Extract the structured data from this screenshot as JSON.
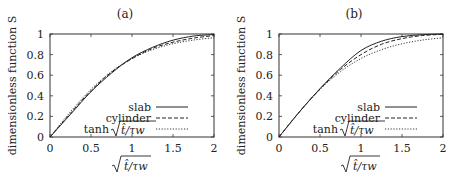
{
  "chart_data": [
    {
      "panel": "(a)",
      "type": "line",
      "title": "(a)",
      "xlabel": "√(t̂/τw)",
      "ylabel": "dimensionless function S",
      "xlim": [
        0,
        2
      ],
      "ylim": [
        0,
        1
      ],
      "xticks": [
        "0",
        "0.5",
        "1",
        "1.5",
        "2"
      ],
      "yticks": [
        "0",
        "0.2",
        "0.4",
        "0.6",
        "0.8",
        "1"
      ],
      "grid": false,
      "legend_position": "lower right",
      "x": [
        0,
        0.25,
        0.5,
        0.75,
        1.0,
        1.25,
        1.5,
        1.75,
        2.0
      ],
      "series": [
        {
          "name": "slab",
          "style": "solid",
          "values": [
            0,
            0.22,
            0.44,
            0.62,
            0.77,
            0.87,
            0.94,
            0.98,
            0.995
          ]
        },
        {
          "name": "cylinder",
          "style": "dashed",
          "values": [
            0,
            0.23,
            0.45,
            0.63,
            0.76,
            0.86,
            0.92,
            0.96,
            0.985
          ]
        },
        {
          "name": "tanh √(t̂/τw)",
          "style": "dotted",
          "values": [
            0,
            0.245,
            0.462,
            0.635,
            0.762,
            0.848,
            0.905,
            0.941,
            0.964
          ]
        }
      ]
    },
    {
      "panel": "(b)",
      "type": "line",
      "title": "(b)",
      "xlabel": "√(t̂/τw)",
      "ylabel": "dimensionless function S",
      "xlim": [
        0,
        2
      ],
      "ylim": [
        0,
        1
      ],
      "xticks": [
        "0",
        "0.5",
        "1",
        "1.5",
        "2"
      ],
      "yticks": [
        "0",
        "0.2",
        "0.4",
        "0.6",
        "0.8",
        "1"
      ],
      "grid": false,
      "legend_position": "lower right",
      "x": [
        0,
        0.25,
        0.5,
        0.75,
        1.0,
        1.25,
        1.5,
        1.75,
        2.0
      ],
      "series": [
        {
          "name": "slab",
          "style": "solid",
          "values": [
            0,
            0.245,
            0.47,
            0.67,
            0.84,
            0.93,
            0.975,
            0.993,
            1.0
          ]
        },
        {
          "name": "cylinder",
          "style": "dashed",
          "values": [
            0,
            0.245,
            0.465,
            0.655,
            0.8,
            0.9,
            0.955,
            0.985,
            0.997
          ]
        },
        {
          "name": "tanh √(t̂/τw)",
          "style": "dotted",
          "values": [
            0,
            0.245,
            0.462,
            0.635,
            0.762,
            0.848,
            0.905,
            0.941,
            0.964
          ]
        }
      ]
    }
  ],
  "panels": [
    {
      "title": "(a)",
      "ylabel": "dimensionless function S",
      "xlabel_prefix": "√",
      "xlabel_body": "t̂/τw",
      "legend": [
        "slab",
        "cylinder",
        "tanh"
      ],
      "legend_tanh_arg": "t̂/τw"
    },
    {
      "title": "(b)",
      "ylabel": "dimensionless function S",
      "xlabel_prefix": "√",
      "xlabel_body": "t̂/τw",
      "legend": [
        "slab",
        "cylinder",
        "tanh"
      ],
      "legend_tanh_arg": "t̂/τw"
    }
  ]
}
